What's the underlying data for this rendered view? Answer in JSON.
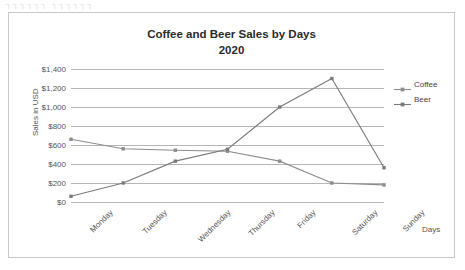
{
  "artifact_text": "┐┐┐┐┐┐  ┐┐┐┐┐┐",
  "chart_data": {
    "type": "line",
    "title": "Coffee and Beer Sales by Days",
    "subtitle": "2020",
    "xlabel": "Days",
    "ylabel": "Sales in USD",
    "ylim": [
      0,
      1400
    ],
    "ytick_step": 200,
    "ytick_labels": [
      "$0",
      "$200",
      "$400",
      "$600",
      "$800",
      "$1,000",
      "$1,200",
      "$1,400"
    ],
    "ytick_values": [
      0,
      200,
      400,
      600,
      800,
      1000,
      1200,
      1400
    ],
    "grid": true,
    "legend_position": "right",
    "categories": [
      "Monday",
      "Tuesday",
      "Wednesday",
      "Thursday",
      "Friday",
      "Saturday",
      "Sunday"
    ],
    "series": [
      {
        "name": "Coffee",
        "color": "#8c8c8c",
        "values": [
          660,
          560,
          545,
          535,
          430,
          200,
          180
        ]
      },
      {
        "name": "Beer",
        "color": "#7a7a7a",
        "values": [
          60,
          200,
          430,
          555,
          1000,
          1300,
          360
        ]
      }
    ]
  },
  "colors": {
    "frame_border": "#c8c8c8",
    "gridline": "#b6b6b6",
    "axis_text": "#555555",
    "title_text": "#2b2b2b"
  }
}
